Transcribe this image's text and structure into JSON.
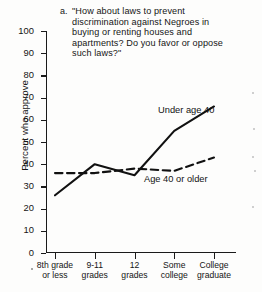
{
  "figure": {
    "marker": "a.",
    "title_lines": [
      "\"How about laws to prevent",
      "discrimination against Negroes in",
      "buying or renting houses and",
      "apartments? Do you favor or oppose",
      "such laws?\""
    ],
    "title_full": "a. \"How about laws to prevent discrimination against Negroes in buying or renting houses and apartments? Do you favor or oppose such laws?\""
  },
  "chart_data": {
    "type": "line",
    "title": "\"How about laws to prevent discrimination against Negroes in buying or renting houses and apartments? Do you favor or oppose such laws?\"",
    "xlabel": "",
    "ylabel": "Percent who approve",
    "ylim": [
      0,
      100
    ],
    "ytick_step": 10,
    "yticks": [
      0,
      10,
      20,
      30,
      40,
      50,
      60,
      70,
      80,
      90,
      100
    ],
    "ytick_labels": [
      "0",
      "10",
      "20",
      "30",
      "40",
      "50",
      "60",
      "70",
      "80",
      "90",
      "100"
    ],
    "categories": [
      "8th grade or less",
      "9-11 grades",
      "12 grades",
      "Some college",
      "College graduate"
    ],
    "category_lines": [
      [
        "8th grade",
        "or less"
      ],
      [
        "9-11",
        "grades"
      ],
      [
        "12",
        "grades"
      ],
      [
        "Some",
        "college"
      ],
      [
        "College",
        "graduate"
      ]
    ],
    "grid": false,
    "legend_position": "inline-annotations",
    "series": [
      {
        "name": "Under age 40",
        "style": "solid",
        "color": "#111111",
        "values": [
          26,
          40,
          35,
          55,
          66
        ]
      },
      {
        "name": "Age 40 or older",
        "style": "dashed",
        "color": "#111111",
        "values": [
          36,
          36,
          38,
          37,
          43
        ]
      }
    ],
    "annotations": [
      {
        "text": "Under age 40",
        "series": "Under age 40"
      },
      {
        "text": "Age 40 or older",
        "series": "Age 40 or older"
      }
    ]
  }
}
